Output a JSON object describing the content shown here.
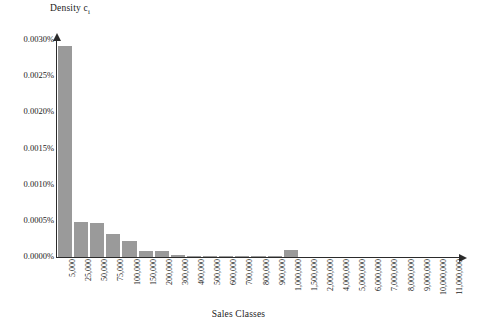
{
  "chart_data": {
    "type": "bar",
    "title": "",
    "ylabel": "Density cᵢ",
    "ylabel_text": "Density c",
    "ylabel_sub": "i",
    "xlabel": "Sales Classes",
    "grid": false,
    "legend": "none",
    "ylim": [
      0.0,
      0.003
    ],
    "ytick_labels": [
      "0.0030%",
      "0.0025%",
      "0.0020%",
      "0.0015%",
      "0.0010%",
      "0.0005%",
      "0.0000%"
    ],
    "ytick_values": [
      0.003,
      0.0025,
      0.002,
      0.0015,
      0.001,
      0.0005,
      0.0
    ],
    "yunit": "%",
    "categories": [
      "5,000",
      "25,000",
      "50,000",
      "75,000",
      "100,000",
      "150,000",
      "200,000",
      "300,000",
      "400,000",
      "500,000",
      "600,000",
      "700,000",
      "800,000",
      "900,000",
      "1,000,000",
      "1,500,000",
      "2,000,000",
      "4,000,000",
      "5,000,000",
      "6,000,000",
      "7,000,000",
      "8,000,000",
      "9,000,000",
      "10,000,000",
      "11,000,000"
    ],
    "values": [
      0.00292,
      0.00048,
      0.00047,
      0.00032,
      0.00022,
      9e-05,
      8e-05,
      3e-05,
      1e-05,
      1e-05,
      1e-05,
      1e-05,
      1e-05,
      1e-05,
      0.0001,
      0.0,
      0.0,
      0.0,
      0.0,
      0.0,
      0.0,
      0.0,
      0.0,
      0.0,
      0.0
    ],
    "bar_color": "#9a9a9a",
    "axis_color": "#2b2b2b"
  }
}
